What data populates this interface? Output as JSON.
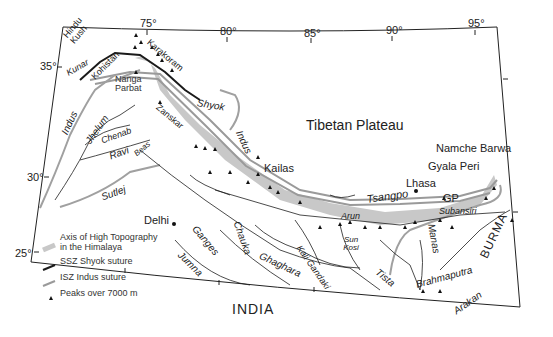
{
  "map": {
    "title": "Himalaya and Tibetan Plateau",
    "longitude_ticks": [
      "75°",
      "80°",
      "85°",
      "90°",
      "95°"
    ],
    "latitude_ticks": [
      "35°",
      "30°",
      "25°"
    ],
    "regions": {
      "tibetan_plateau": "Tibetan Plateau",
      "india": "INDIA",
      "burma": "BURMA",
      "hindu_kush": "Hindu Kush",
      "karakoram": "Karakoram",
      "kohistan": "Kohistan",
      "nanga_parbat": "Nanga Parbat",
      "zanskar": "Zanskar"
    },
    "places": {
      "kailas": "Kailas",
      "lhasa": "Lhasa",
      "delhi": "Delhi",
      "namche_barwa": "Namche Barwa",
      "gyala_peri": "Gyala Peri",
      "gp": "GP"
    },
    "rivers": {
      "kunar": "Kunar",
      "indus_west": "Indus",
      "indus_east": "Indus",
      "jhelum": "Jhelum",
      "chenab": "Chenab",
      "ravi": "Ravi",
      "beas": "Beas",
      "sutlej": "Sutlej",
      "shyok": "Shyok",
      "tsangpo": "Tsangpo",
      "ganges": "Ganges",
      "jumna": "Jumna",
      "chauka": "Chauka",
      "ghaghara": "Ghaghara",
      "kali_gandaki": "Kali Gandaki",
      "arun": "Arun",
      "sun_kosi": "Sun Kosi",
      "tista": "Tista",
      "manas": "Manas",
      "subansiri": "Subansiri",
      "brahmaputra": "Brahmaputra",
      "arakan": "Arakan"
    },
    "legend": [
      {
        "symbol": "grey-band",
        "label": "Axis of High Topography in the Himalaya"
      },
      {
        "symbol": "dark-line",
        "label": "SSZ Shyok suture"
      },
      {
        "symbol": "grey-line",
        "label": "ISZ Indus suture"
      },
      {
        "symbol": "triangle",
        "label": "Peaks over 7000 m"
      }
    ],
    "colors": {
      "topography_band": "#c8c8c8",
      "river": "#1e1e1e",
      "major_river": "#a0a0a0",
      "shyok_suture": "#1a1a1a",
      "indus_suture": "#9a9a9a",
      "frame": "#222222"
    }
  }
}
